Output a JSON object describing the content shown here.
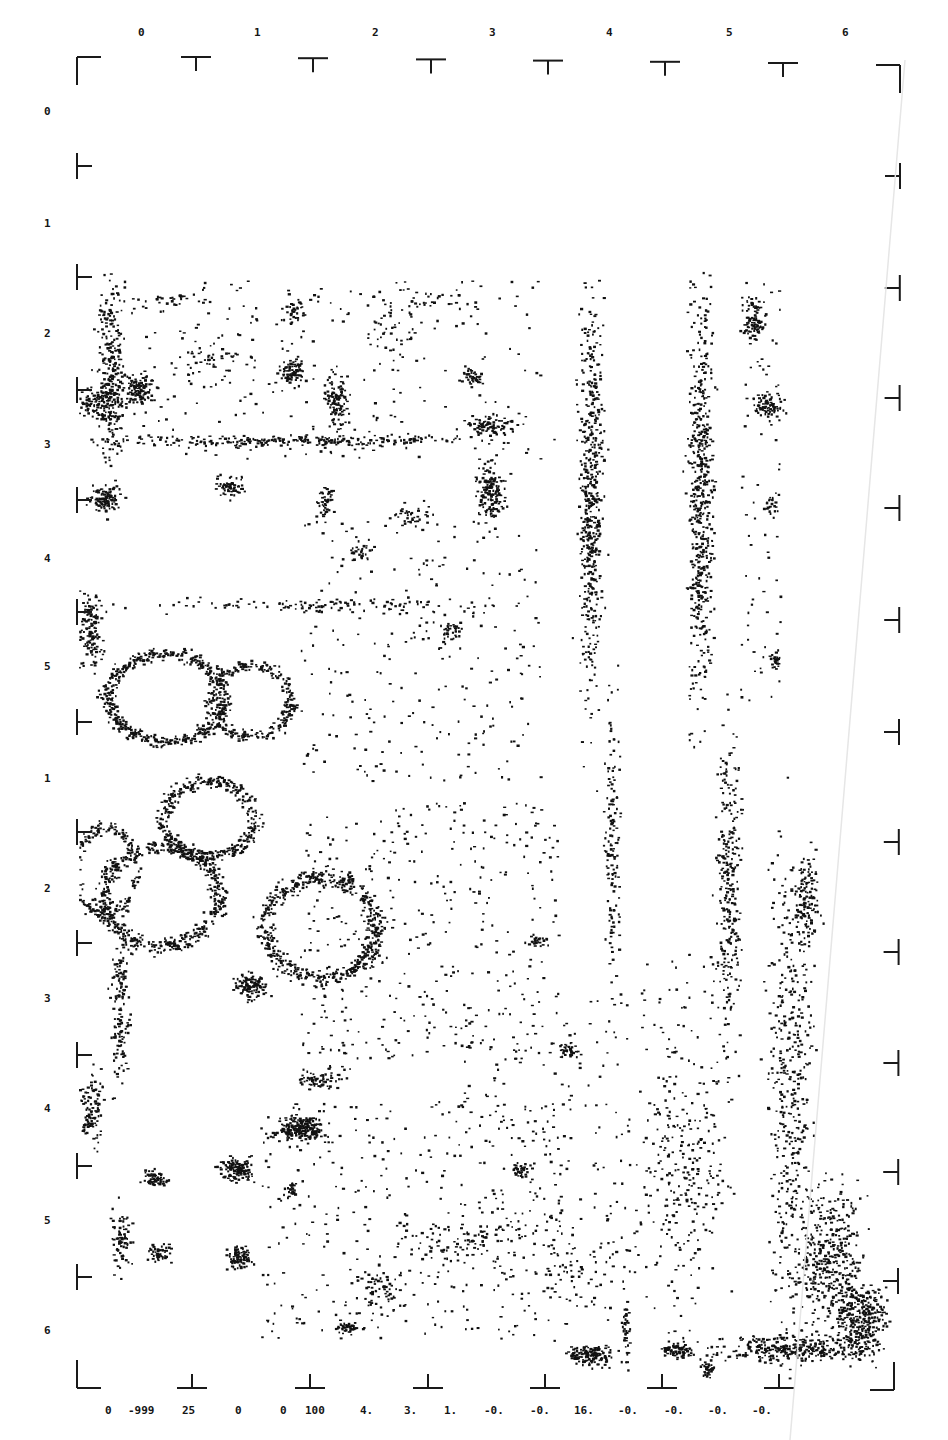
{
  "frame": {
    "left": 77,
    "right": 900,
    "top": 57,
    "bottom": 1388,
    "stroke_color": "#1a1a1a"
  },
  "top_axis": {
    "labels": [
      "0",
      "1",
      "2",
      "3",
      "4",
      "5",
      "6"
    ],
    "label_x": [
      138,
      254,
      372,
      489,
      606,
      726,
      842
    ],
    "label_y": 34,
    "tick_x": [
      196,
      313,
      431,
      548,
      665,
      783
    ]
  },
  "left_axis": {
    "labels": [
      "0",
      "1",
      "2",
      "3",
      "4",
      "5",
      "1",
      "2",
      "3",
      "4",
      "5",
      "6"
    ],
    "label_y": [
      113,
      225,
      335,
      446,
      560,
      668,
      780,
      890,
      1000,
      1110,
      1222,
      1332
    ],
    "label_x": 44,
    "tick_y": [
      166,
      277,
      390,
      500,
      612,
      722,
      832,
      943,
      1055,
      1166,
      1277
    ]
  },
  "right_axis": {
    "tick_y": [
      176,
      288,
      398,
      508,
      620,
      732,
      842,
      952,
      1063,
      1172,
      1281
    ]
  },
  "bottom_axis": {
    "tick_x": [
      192,
      310,
      428,
      545,
      662,
      779
    ],
    "values": [
      "0",
      "-999",
      "25",
      "0",
      "0",
      "100",
      "4.",
      "3.",
      "1.",
      "-0.",
      "-0.",
      "16.",
      "-0.",
      "-0.",
      "-0.",
      "-0."
    ],
    "value_x": [
      105,
      128,
      182,
      235,
      280,
      305,
      360,
      404,
      444,
      484,
      530,
      574,
      618,
      664,
      708,
      752
    ]
  },
  "image": {
    "ink_color": "#111111",
    "description": "dot-density scanned plot",
    "clusters": [
      {
        "x": 110,
        "y": 370,
        "rx": 14,
        "ry": 95,
        "n": 260
      },
      {
        "x": 95,
        "y": 402,
        "rx": 22,
        "ry": 18,
        "n": 120
      },
      {
        "x": 140,
        "y": 388,
        "rx": 16,
        "ry": 16,
        "n": 110
      },
      {
        "x": 105,
        "y": 498,
        "rx": 16,
        "ry": 15,
        "n": 110
      },
      {
        "x": 230,
        "y": 486,
        "rx": 14,
        "ry": 12,
        "n": 70
      },
      {
        "x": 292,
        "y": 370,
        "rx": 13,
        "ry": 13,
        "n": 80
      },
      {
        "x": 293,
        "y": 310,
        "rx": 12,
        "ry": 14,
        "n": 40
      },
      {
        "x": 335,
        "y": 400,
        "rx": 12,
        "ry": 30,
        "n": 110
      },
      {
        "x": 300,
        "y": 440,
        "rx": 200,
        "ry": 6,
        "n": 260
      },
      {
        "x": 490,
        "y": 425,
        "rx": 30,
        "ry": 10,
        "n": 80
      },
      {
        "x": 490,
        "y": 490,
        "rx": 14,
        "ry": 30,
        "n": 160
      },
      {
        "x": 473,
        "y": 377,
        "rx": 12,
        "ry": 10,
        "n": 40
      },
      {
        "x": 325,
        "y": 500,
        "rx": 12,
        "ry": 20,
        "n": 50
      },
      {
        "x": 410,
        "y": 515,
        "rx": 20,
        "ry": 14,
        "n": 40
      },
      {
        "x": 360,
        "y": 550,
        "rx": 10,
        "ry": 14,
        "n": 30
      },
      {
        "x": 450,
        "y": 630,
        "rx": 10,
        "ry": 10,
        "n": 30
      },
      {
        "x": 300,
        "y": 605,
        "rx": 225,
        "ry": 8,
        "n": 110
      },
      {
        "x": 400,
        "y": 340,
        "rx": 30,
        "ry": 30,
        "n": 40
      },
      {
        "x": 210,
        "y": 360,
        "rx": 40,
        "ry": 20,
        "n": 35
      },
      {
        "x": 160,
        "y": 300,
        "rx": 60,
        "ry": 14,
        "n": 35
      },
      {
        "x": 420,
        "y": 300,
        "rx": 60,
        "ry": 16,
        "n": 40
      },
      {
        "x": 590,
        "y": 500,
        "rx": 13,
        "ry": 210,
        "n": 520
      },
      {
        "x": 612,
        "y": 850,
        "rx": 9,
        "ry": 150,
        "n": 140
      },
      {
        "x": 700,
        "y": 500,
        "rx": 14,
        "ry": 215,
        "n": 560
      },
      {
        "x": 728,
        "y": 880,
        "rx": 13,
        "ry": 150,
        "n": 280
      },
      {
        "x": 752,
        "y": 320,
        "rx": 12,
        "ry": 22,
        "n": 90
      },
      {
        "x": 768,
        "y": 405,
        "rx": 14,
        "ry": 12,
        "n": 80
      },
      {
        "x": 770,
        "y": 505,
        "rx": 6,
        "ry": 10,
        "n": 20
      },
      {
        "x": 775,
        "y": 660,
        "rx": 7,
        "ry": 12,
        "n": 25
      },
      {
        "x": 90,
        "y": 630,
        "rx": 14,
        "ry": 40,
        "n": 140
      },
      {
        "x": 540,
        "y": 940,
        "rx": 12,
        "ry": 8,
        "n": 25
      },
      {
        "x": 590,
        "y": 1270,
        "rx": 60,
        "ry": 60,
        "n": 80
      },
      {
        "x": 680,
        "y": 1200,
        "rx": 40,
        "ry": 140,
        "n": 180
      },
      {
        "x": 790,
        "y": 1100,
        "rx": 25,
        "ry": 260,
        "n": 450
      },
      {
        "x": 805,
        "y": 900,
        "rx": 14,
        "ry": 40,
        "n": 130
      },
      {
        "x": 830,
        "y": 1260,
        "rx": 35,
        "ry": 80,
        "n": 380
      },
      {
        "x": 860,
        "y": 1320,
        "rx": 28,
        "ry": 40,
        "n": 300
      },
      {
        "x": 790,
        "y": 1348,
        "rx": 80,
        "ry": 14,
        "n": 320
      },
      {
        "x": 590,
        "y": 1355,
        "rx": 25,
        "ry": 10,
        "n": 150
      },
      {
        "x": 676,
        "y": 1350,
        "rx": 16,
        "ry": 8,
        "n": 80
      },
      {
        "x": 706,
        "y": 1370,
        "rx": 8,
        "ry": 10,
        "n": 40
      },
      {
        "x": 625,
        "y": 1330,
        "rx": 5,
        "ry": 40,
        "n": 40
      },
      {
        "x": 570,
        "y": 1050,
        "rx": 10,
        "ry": 8,
        "n": 40
      },
      {
        "x": 520,
        "y": 1170,
        "rx": 10,
        "ry": 8,
        "n": 35
      },
      {
        "x": 120,
        "y": 1000,
        "rx": 10,
        "ry": 90,
        "n": 150
      },
      {
        "x": 90,
        "y": 1110,
        "rx": 16,
        "ry": 40,
        "n": 110
      },
      {
        "x": 155,
        "y": 1178,
        "rx": 14,
        "ry": 10,
        "n": 60
      },
      {
        "x": 120,
        "y": 1240,
        "rx": 10,
        "ry": 35,
        "n": 80
      },
      {
        "x": 160,
        "y": 1252,
        "rx": 14,
        "ry": 10,
        "n": 50
      },
      {
        "x": 236,
        "y": 1168,
        "rx": 18,
        "ry": 13,
        "n": 130
      },
      {
        "x": 238,
        "y": 1257,
        "rx": 12,
        "ry": 11,
        "n": 90
      },
      {
        "x": 290,
        "y": 1188,
        "rx": 7,
        "ry": 7,
        "n": 25
      },
      {
        "x": 300,
        "y": 1128,
        "rx": 26,
        "ry": 14,
        "n": 220
      },
      {
        "x": 320,
        "y": 1078,
        "rx": 28,
        "ry": 12,
        "n": 70
      },
      {
        "x": 250,
        "y": 986,
        "rx": 16,
        "ry": 14,
        "n": 110
      },
      {
        "x": 345,
        "y": 1327,
        "rx": 10,
        "ry": 6,
        "n": 40
      },
      {
        "x": 380,
        "y": 1290,
        "rx": 30,
        "ry": 20,
        "n": 60
      },
      {
        "x": 460,
        "y": 1240,
        "rx": 80,
        "ry": 20,
        "n": 90
      }
    ],
    "rings": [
      {
        "x": 165,
        "y": 697,
        "rx": 58,
        "ry": 44,
        "w": 14,
        "n": 520
      },
      {
        "x": 250,
        "y": 700,
        "rx": 40,
        "ry": 36,
        "w": 12,
        "n": 260
      },
      {
        "x": 208,
        "y": 818,
        "rx": 46,
        "ry": 38,
        "w": 14,
        "n": 380
      },
      {
        "x": 160,
        "y": 895,
        "rx": 58,
        "ry": 50,
        "w": 16,
        "n": 520
      },
      {
        "x": 105,
        "y": 870,
        "rx": 30,
        "ry": 44,
        "w": 12,
        "n": 200
      },
      {
        "x": 320,
        "y": 927,
        "rx": 56,
        "ry": 50,
        "w": 16,
        "n": 560
      }
    ],
    "sparse_fields": [
      {
        "x": 300,
        "y": 800,
        "w": 260,
        "h": 260,
        "n": 380
      },
      {
        "x": 300,
        "y": 520,
        "w": 240,
        "h": 260,
        "n": 260
      },
      {
        "x": 260,
        "y": 1100,
        "w": 300,
        "h": 240,
        "n": 320
      },
      {
        "x": 460,
        "y": 1000,
        "w": 180,
        "h": 280,
        "n": 200
      },
      {
        "x": 100,
        "y": 280,
        "w": 440,
        "h": 180,
        "n": 260
      },
      {
        "x": 640,
        "y": 950,
        "w": 100,
        "h": 260,
        "n": 150
      },
      {
        "x": 740,
        "y": 280,
        "w": 40,
        "h": 420,
        "n": 80
      }
    ]
  }
}
